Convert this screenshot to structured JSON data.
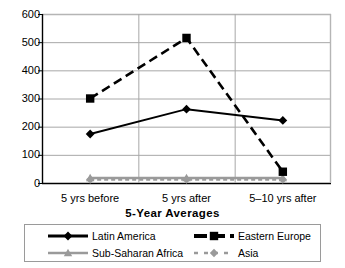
{
  "chart_data": {
    "type": "line",
    "title": "",
    "subtitle": "",
    "xlabel": "5-Year Averages",
    "ylabel": "",
    "categories": [
      "5 yrs before",
      "5 yrs after",
      "5–10 yrs after"
    ],
    "ylim": [
      0,
      600
    ],
    "yticks": [
      0,
      100,
      200,
      300,
      400,
      500,
      600
    ],
    "ytick_labels": [
      "0",
      "100",
      "200",
      "300",
      "400",
      "500",
      "600"
    ],
    "grid": "horizontal-and-vertical",
    "legend_position": "bottom",
    "series": [
      {
        "name": "Latin America",
        "values": [
          174,
          262,
          222
        ],
        "color": "#000000",
        "marker": "diamond",
        "linestyle": "solid"
      },
      {
        "name": "Eastern Europe",
        "values": [
          300,
          515,
          40
        ],
        "color": "#000000",
        "marker": "square",
        "linestyle": "dashed"
      },
      {
        "name": "Sub-Saharan Africa",
        "values": [
          18,
          18,
          18
        ],
        "color": "#9a9a9a",
        "marker": "triangle",
        "linestyle": "solid"
      },
      {
        "name": "Asia",
        "values": [
          12,
          12,
          12
        ],
        "color": "#9a9a9a",
        "marker": "diamond",
        "linestyle": "dashed"
      }
    ]
  },
  "colors": {
    "axis": "#000000",
    "gridline": "#a8a8a8",
    "plot_border": "#b5b5b5",
    "legend_border": "#9a9a9a",
    "series_dark": "#000000",
    "series_gray": "#9a9a9a",
    "background": "#ffffff"
  }
}
